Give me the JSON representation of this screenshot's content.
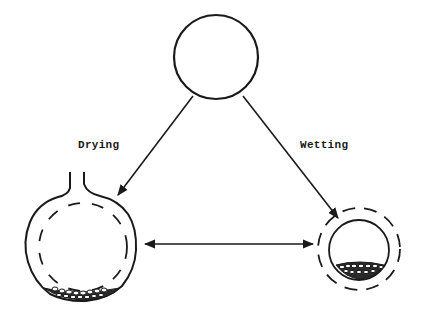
{
  "diagram": {
    "labels": {
      "drying": "Drying",
      "wetting": "Wetting"
    },
    "nodes": [
      {
        "id": "initial-state",
        "shape": "circle",
        "description": "initial state (plain circle)"
      },
      {
        "id": "dried-state",
        "shape": "large-bulb-with-neck",
        "description": "large swollen cell with neck, dashed inner membrane, particles settled at bottom"
      },
      {
        "id": "wetted-state",
        "shape": "small-circle-with-dashed-outline",
        "description": "small cell inside dashed outer boundary, particles at bottom"
      }
    ],
    "edges": [
      {
        "from": "initial-state",
        "to": "dried-state",
        "label_ref": "drying",
        "type": "single-arrow"
      },
      {
        "from": "initial-state",
        "to": "wetted-state",
        "label_ref": "wetting",
        "type": "single-arrow"
      },
      {
        "from": "dried-state",
        "to": "wetted-state",
        "type": "double-arrow"
      }
    ],
    "colors": {
      "stroke": "#1a1a1a",
      "background": "#ffffff"
    }
  }
}
